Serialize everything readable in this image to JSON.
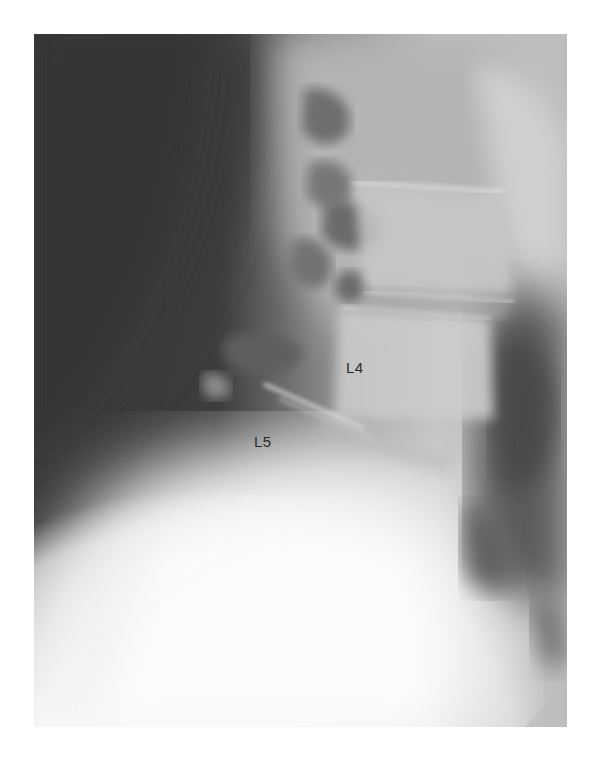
{
  "image": {
    "type": "lateral lumbar spine radiograph",
    "colors": {
      "dark_soft_tissue": "#3a3a3a",
      "bone_bright": "#f4f4f4",
      "mid_gray": "#a8a8a8",
      "label_text": "#2a2a2a",
      "page_background": "#ffffff"
    }
  },
  "labels": [
    {
      "text": "L4",
      "x": 346,
      "y": 360
    },
    {
      "text": "L5",
      "x": 254,
      "y": 434
    }
  ]
}
